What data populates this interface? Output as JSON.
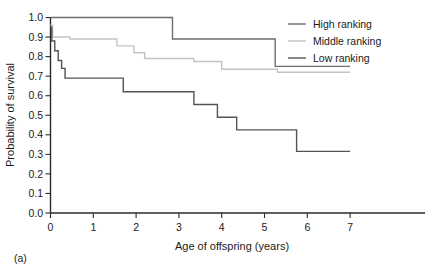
{
  "panel": {
    "label": "(a)"
  },
  "chart_data": {
    "type": "line",
    "subtype": "step",
    "title": "",
    "xlabel": "Age of offspring (years)",
    "ylabel": "Probability of survival",
    "xlim": [
      0,
      7.6
    ],
    "ylim": [
      0.0,
      1.0
    ],
    "xticks": [
      0,
      1,
      2,
      3,
      4,
      5,
      6,
      7
    ],
    "xticklabels": [
      "0",
      "1",
      "2",
      "3",
      "4",
      "5",
      "6",
      "7"
    ],
    "yticks": [
      0.0,
      0.1,
      0.2,
      0.3,
      0.4,
      0.5,
      0.6,
      0.7,
      0.8,
      0.9,
      1.0
    ],
    "yticklabels": [
      "0.0",
      "0.1",
      "0.2",
      "0.3",
      "0.4",
      "0.5",
      "0.6",
      "0.7",
      "0.8",
      "0.9",
      "1.0"
    ],
    "grid": false,
    "legend_position": "top-right",
    "series": [
      {
        "name": "High ranking",
        "color": "#6e6e6e",
        "x": [
          0.0,
          2.85,
          2.85,
          5.25,
          5.25,
          7.0
        ],
        "y": [
          1.0,
          1.0,
          0.89,
          0.89,
          0.75,
          0.75
        ]
      },
      {
        "name": "Middle ranking",
        "color": "#c3c3c3",
        "x": [
          0.0,
          0.05,
          0.05,
          0.45,
          0.45,
          1.55,
          1.55,
          1.95,
          1.95,
          2.2,
          2.2,
          3.35,
          3.35,
          4.0,
          4.0,
          5.3,
          5.3,
          7.0
        ],
        "y": [
          0.96,
          0.96,
          0.9,
          0.9,
          0.89,
          0.89,
          0.855,
          0.855,
          0.82,
          0.82,
          0.79,
          0.79,
          0.775,
          0.775,
          0.735,
          0.735,
          0.72,
          0.72
        ]
      },
      {
        "name": "Low ranking",
        "color": "#545454",
        "x": [
          0.0,
          0.03,
          0.03,
          0.1,
          0.1,
          0.18,
          0.18,
          0.26,
          0.26,
          0.34,
          0.34,
          1.7,
          1.7,
          3.35,
          3.35,
          3.9,
          3.9,
          4.35,
          4.35,
          5.75,
          5.75,
          7.0
        ],
        "y": [
          0.95,
          0.95,
          0.88,
          0.88,
          0.83,
          0.83,
          0.78,
          0.78,
          0.74,
          0.74,
          0.69,
          0.69,
          0.62,
          0.62,
          0.555,
          0.555,
          0.49,
          0.49,
          0.425,
          0.425,
          0.315,
          0.315
        ]
      }
    ],
    "legend": [
      {
        "label": "High ranking",
        "color": "#6e6e6e"
      },
      {
        "label": "Middle ranking",
        "color": "#c3c3c3"
      },
      {
        "label": "Low ranking",
        "color": "#545454"
      }
    ]
  }
}
